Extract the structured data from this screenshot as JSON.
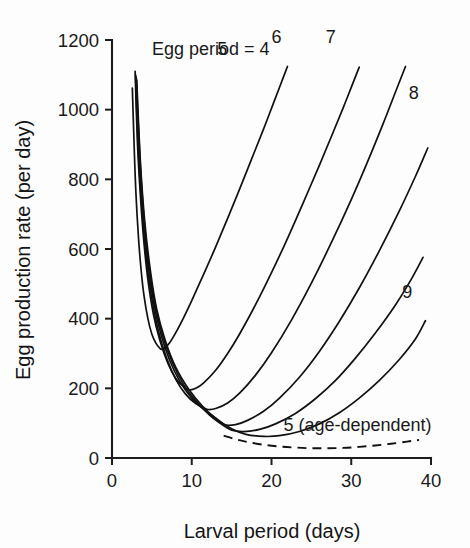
{
  "figure": {
    "background_color": "#fdfdfd",
    "line_color": "#111111"
  },
  "chart_data": {
    "type": "line",
    "title": "",
    "xlabel": "Larval period (days)",
    "ylabel": "Egg production rate (per day)",
    "xlim": [
      0,
      40
    ],
    "ylim": [
      0,
      1200
    ],
    "xticks": [
      0,
      10,
      20,
      30,
      40
    ],
    "yticks": [
      0,
      200,
      400,
      600,
      800,
      1000,
      1200
    ],
    "xtick_labels": [
      "0",
      "10",
      "20",
      "30",
      "40"
    ],
    "ytick_labels": [
      "0",
      "200",
      "400",
      "600",
      "800",
      "1000",
      "1200"
    ],
    "grid": false,
    "legend_position": "inline-curve-labels",
    "annotations": [
      {
        "text": "Egg period = 4",
        "x": 5.0,
        "y": 1158
      },
      {
        "text": "5",
        "x": 13.2,
        "y": 1158
      },
      {
        "text": "6",
        "x": 20.0,
        "y": 1190
      },
      {
        "text": "7",
        "x": 26.8,
        "y": 1190
      },
      {
        "text": "8",
        "x": 37.2,
        "y": 1032
      },
      {
        "text": "9",
        "x": 36.4,
        "y": 458
      },
      {
        "text": "5 (age-dependent)",
        "x": 21.5,
        "y": 78
      }
    ],
    "series": [
      {
        "name": "Egg period = 4",
        "label": "Egg period = 4",
        "style": "solid",
        "minimum": {
          "x": 6.2,
          "y": 312
        },
        "points": [
          [
            2.55,
            1062
          ],
          [
            2.8,
            880
          ],
          [
            3.0,
            760
          ],
          [
            3.3,
            640
          ],
          [
            3.6,
            552
          ],
          [
            4.0,
            468
          ],
          [
            4.5,
            400
          ],
          [
            5.0,
            355
          ],
          [
            5.5,
            330
          ],
          [
            6.0,
            315
          ],
          [
            6.2,
            312
          ],
          [
            6.6,
            315
          ],
          [
            7.2,
            330
          ],
          [
            8.0,
            360
          ],
          [
            9.0,
            404
          ],
          [
            10.0,
            452
          ],
          [
            11.5,
            528
          ],
          [
            13.0,
            606
          ],
          [
            14.5,
            688
          ],
          [
            16.0,
            772
          ],
          [
            17.5,
            858
          ],
          [
            19.0,
            944
          ],
          [
            20.2,
            1016
          ],
          [
            21.2,
            1076
          ],
          [
            22.0,
            1124
          ]
        ]
      },
      {
        "name": "Egg period = 5",
        "label": "5",
        "style": "solid",
        "minimum": {
          "x": 9.7,
          "y": 196
        },
        "points": [
          [
            2.9,
            1110
          ],
          [
            3.2,
            900
          ],
          [
            3.6,
            740
          ],
          [
            4.0,
            620
          ],
          [
            4.5,
            512
          ],
          [
            5.2,
            412
          ],
          [
            6.0,
            338
          ],
          [
            7.0,
            272
          ],
          [
            8.0,
            228
          ],
          [
            9.0,
            204
          ],
          [
            9.7,
            196
          ],
          [
            10.5,
            200
          ],
          [
            11.5,
            216
          ],
          [
            13.0,
            252
          ],
          [
            14.5,
            300
          ],
          [
            16.0,
            356
          ],
          [
            18.0,
            440
          ],
          [
            20.0,
            532
          ],
          [
            22.0,
            630
          ],
          [
            24.0,
            734
          ],
          [
            26.0,
            840
          ],
          [
            27.6,
            928
          ],
          [
            29.0,
            1006
          ],
          [
            30.0,
            1064
          ],
          [
            31.0,
            1122
          ]
        ]
      },
      {
        "name": "Egg period = 6",
        "label": "6",
        "style": "solid",
        "minimum": {
          "x": 11.9,
          "y": 140
        },
        "points": [
          [
            2.95,
            1100
          ],
          [
            3.3,
            880
          ],
          [
            3.8,
            700
          ],
          [
            4.3,
            572
          ],
          [
            5.0,
            456
          ],
          [
            5.8,
            366
          ],
          [
            6.8,
            290
          ],
          [
            8.0,
            226
          ],
          [
            9.2,
            184
          ],
          [
            10.5,
            156
          ],
          [
            11.9,
            140
          ],
          [
            13.0,
            142
          ],
          [
            14.5,
            158
          ],
          [
            16.0,
            186
          ],
          [
            18.0,
            238
          ],
          [
            20.0,
            302
          ],
          [
            22.5,
            396
          ],
          [
            25.0,
            502
          ],
          [
            27.5,
            618
          ],
          [
            30.0,
            742
          ],
          [
            32.0,
            848
          ],
          [
            34.0,
            960
          ],
          [
            35.5,
            1048
          ],
          [
            36.8,
            1124
          ]
        ]
      },
      {
        "name": "Egg period = 7",
        "label": "7",
        "style": "solid",
        "minimum": {
          "x": 14.0,
          "y": 92
        },
        "points": [
          [
            3.0,
            1095
          ],
          [
            3.4,
            870
          ],
          [
            3.9,
            700
          ],
          [
            4.5,
            560
          ],
          [
            5.2,
            450
          ],
          [
            6.1,
            358
          ],
          [
            7.2,
            282
          ],
          [
            8.5,
            220
          ],
          [
            10.0,
            172
          ],
          [
            11.5,
            140
          ],
          [
            13.0,
            114
          ],
          [
            14.0,
            96
          ],
          [
            15.5,
            96
          ],
          [
            17.0,
            108
          ],
          [
            19.0,
            134
          ],
          [
            21.0,
            172
          ],
          [
            23.5,
            232
          ],
          [
            26.0,
            306
          ],
          [
            28.5,
            392
          ],
          [
            31.0,
            488
          ],
          [
            33.5,
            594
          ],
          [
            36.0,
            708
          ],
          [
            38.0,
            806
          ],
          [
            39.6,
            890
          ]
        ]
      },
      {
        "name": "Egg period = 8",
        "label": "8",
        "style": "solid",
        "minimum": {
          "x": 14.6,
          "y": 72
        },
        "points": [
          [
            3.05,
            1090
          ],
          [
            3.5,
            860
          ],
          [
            4.0,
            690
          ],
          [
            4.6,
            556
          ],
          [
            5.4,
            440
          ],
          [
            6.4,
            348
          ],
          [
            7.6,
            272
          ],
          [
            9.0,
            210
          ],
          [
            10.6,
            162
          ],
          [
            12.2,
            124
          ],
          [
            13.8,
            96
          ],
          [
            15.0,
            80
          ],
          [
            16.5,
            76
          ],
          [
            18.5,
            82
          ],
          [
            20.5,
            98
          ],
          [
            23.0,
            128
          ],
          [
            25.5,
            170
          ],
          [
            28.0,
            222
          ],
          [
            30.5,
            286
          ],
          [
            33.0,
            358
          ],
          [
            35.5,
            438
          ],
          [
            37.5,
            512
          ],
          [
            39.0,
            576
          ]
        ]
      },
      {
        "name": "Egg period = 9",
        "label": "9",
        "style": "solid",
        "minimum": {
          "x": 16.5,
          "y": 58
        },
        "points": [
          [
            3.1,
            1085
          ],
          [
            3.55,
            855
          ],
          [
            4.1,
            680
          ],
          [
            4.8,
            540
          ],
          [
            5.6,
            428
          ],
          [
            6.7,
            336
          ],
          [
            8.0,
            260
          ],
          [
            9.6,
            198
          ],
          [
            11.3,
            150
          ],
          [
            13.0,
            114
          ],
          [
            15.0,
            84
          ],
          [
            16.8,
            68
          ],
          [
            19.0,
            62
          ],
          [
            21.0,
            64
          ],
          [
            23.5,
            76
          ],
          [
            26.0,
            98
          ],
          [
            28.5,
            130
          ],
          [
            31.0,
            172
          ],
          [
            33.5,
            222
          ],
          [
            36.0,
            282
          ],
          [
            38.0,
            340
          ],
          [
            39.3,
            394
          ]
        ]
      },
      {
        "name": "Egg period = 5 (age-dependent)",
        "label": "5 (age-dependent)",
        "style": "dashed",
        "minimum": {
          "x": 26.0,
          "y": 28
        },
        "points": [
          [
            14.0,
            64
          ],
          [
            15.5,
            54
          ],
          [
            17.0,
            46
          ],
          [
            19.0,
            38
          ],
          [
            21.0,
            33
          ],
          [
            23.0,
            30
          ],
          [
            25.0,
            28
          ],
          [
            27.0,
            28
          ],
          [
            29.0,
            29
          ],
          [
            31.0,
            32
          ],
          [
            33.0,
            36
          ],
          [
            35.0,
            41
          ],
          [
            37.0,
            47
          ],
          [
            38.5,
            52
          ]
        ]
      }
    ]
  }
}
